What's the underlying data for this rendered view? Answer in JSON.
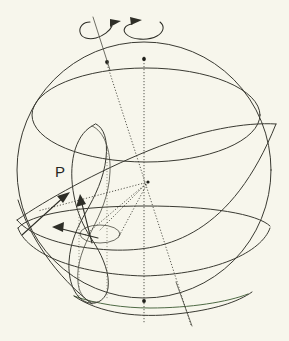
{
  "figure": {
    "width": 289,
    "height": 341,
    "background_color": "#f7f6ec",
    "line_color": "#3a3a32",
    "accent_color": "#4f6b45"
  },
  "labels": {
    "point_p": "P"
  },
  "icons": {
    "rotation_left": "rotation-arrow-icon",
    "rotation_right": "rotation-arrow-icon",
    "vector_up_right": "arrow-icon",
    "vector_up": "arrow-icon",
    "vector_left": "arrow-icon"
  },
  "geometry": {
    "sphere": {
      "center_x": 144,
      "center_y": 170,
      "radius_x": 127,
      "radius_y": 128
    },
    "axes": [
      {
        "name": "precession-axis",
        "top_x": 107,
        "top_y": 64,
        "bottom_x": 191,
        "bottom_y": 325,
        "style": "dotted",
        "pole_marker": true
      },
      {
        "name": "rotation-axis",
        "top_x": 144,
        "top_y": 57,
        "bottom_x": 144,
        "bottom_y": 324,
        "style": "dotted",
        "pole_marker": true
      }
    ],
    "small_circles": [
      {
        "name": "upper-latitude-circle",
        "cx": 146,
        "cy": 115,
        "rx": 114,
        "ry": 47
      },
      {
        "name": "lower-latitude-circle",
        "cx": 144,
        "cy": 242,
        "rx": 117,
        "ry": 34
      },
      {
        "name": "bottom-latitude-circle",
        "cx": 144,
        "cy": 300,
        "rx": 70,
        "ry": 14
      },
      {
        "name": "precession-small-circle",
        "cx": 100,
        "cy": 234,
        "rx": 20,
        "ry": 9
      }
    ],
    "great_circles": [
      {
        "name": "ecliptic-great-circle"
      },
      {
        "name": "nutation-figure-eight"
      }
    ],
    "center_node": {
      "x": 148,
      "y": 182
    }
  },
  "chart_data": {
    "type": "diagram",
    "elements": [
      "celestial sphere outline",
      "ecliptic pole axis (tilted, dotted)",
      "rotation axis (vertical, dotted)",
      "rotation direction arrows",
      "upper latitude circle",
      "equatorial great circle",
      "lower latitude circle",
      "nutation figure-eight loop",
      "precession small circle",
      "radius vectors with arrowheads",
      "label P"
    ],
    "annotations": [
      "P"
    ]
  }
}
